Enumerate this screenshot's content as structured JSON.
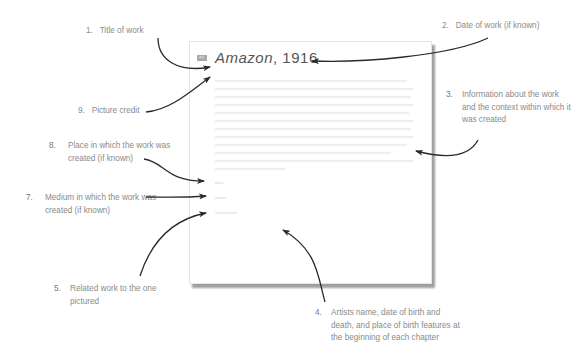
{
  "page": {
    "artwork_title": "Amazon",
    "artwork_date": ", 1916",
    "credit_tag": "PIC",
    "body_line_count": 13,
    "meta": [
      "place",
      "media",
      "related work"
    ]
  },
  "callouts": [
    {
      "num": "1.",
      "text": "Title of work"
    },
    {
      "num": "2.",
      "text": "Date of work (if known)"
    },
    {
      "num": "3.",
      "text": "Information about the work and the context within which it was created"
    },
    {
      "num": "4.",
      "text": "Artists name, date of birth and death, and place of birth features at the beginning of each chapter"
    },
    {
      "num": "5.",
      "text": "Related work to the one pictured"
    },
    {
      "num": "7.",
      "text": "Medium in which the work was created (if known)"
    },
    {
      "num": "8.",
      "text": "Place in which the work was created (if known)"
    },
    {
      "num": "9.",
      "text": "Picture credit"
    }
  ],
  "colors": {
    "arrow": "#2a2a2a",
    "label": "#8a8a8a",
    "shadow": "#9a9a9a"
  }
}
